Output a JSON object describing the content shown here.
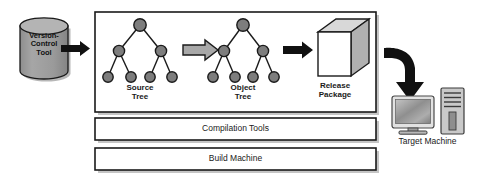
{
  "diagram": {
    "colors": {
      "stroke": "#1a1a1a",
      "cylinder_fill": "#9a9a9a",
      "cylinder_top": "#b4b4b4",
      "node_fill": "#7d7d7d",
      "hollow_arrow_fill": "#a8a8a8",
      "cube_front": "#ffffff",
      "cube_top": "#d8d8d8",
      "cube_side": "#b0b0b0",
      "bar_fill": "#ffffff",
      "shadow": "#8a8a8a",
      "monitor_screen": "#9c9c9c",
      "tower_fill": "#c9c9c9"
    },
    "source": {
      "name": "version-control-tool",
      "label": "Version-\nControl\nTool"
    },
    "arrows": [
      {
        "name": "arrow-vc-to-build",
        "style": "solid"
      },
      {
        "name": "arrow-source-to-object",
        "style": "hollow"
      },
      {
        "name": "arrow-object-to-release",
        "style": "solid"
      },
      {
        "name": "arrow-release-to-target",
        "style": "curved"
      }
    ],
    "stages": [
      {
        "name": "source-tree",
        "label": "Source\nTree",
        "shape": "tree"
      },
      {
        "name": "object-tree",
        "label": "Object\nTree",
        "shape": "tree"
      },
      {
        "name": "release-package",
        "label": "Release\nPackage",
        "shape": "cube"
      }
    ],
    "layers": [
      {
        "name": "compilation-tools-bar",
        "label": "Compilation Tools"
      },
      {
        "name": "build-machine-bar",
        "label": "Build Machine"
      }
    ],
    "target": {
      "name": "target-machine",
      "label": "Target Machine"
    }
  }
}
